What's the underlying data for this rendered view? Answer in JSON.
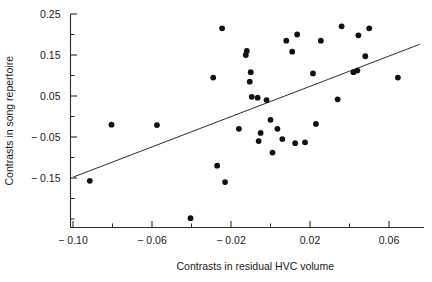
{
  "chart_data": {
    "type": "scatter",
    "title": "",
    "xlabel": "Contrasts in residual HVC volume",
    "ylabel": "Contrasts in song repertoire",
    "xlim": [
      -0.108,
      0.082
    ],
    "ylim": [
      -0.262,
      0.262
    ],
    "grid": false,
    "legend": null,
    "x_ticks": [
      -0.1,
      -0.08,
      -0.06,
      -0.04,
      -0.02,
      0.0,
      0.02,
      0.04,
      0.06,
      0.08
    ],
    "x_tick_labels": [
      "-0.10",
      "",
      "-0.06",
      "",
      "-0.02",
      "",
      "0.02",
      "",
      "0.06",
      ""
    ],
    "y_ticks": [
      0.25,
      0.2,
      0.15,
      0.1,
      0.05,
      0.0,
      -0.05,
      -0.1,
      -0.15,
      -0.2,
      -0.25
    ],
    "y_tick_labels": [
      "0.25",
      "",
      "0.15",
      "",
      "0.05",
      "",
      "-0.05",
      "",
      "-0.15",
      "",
      ""
    ],
    "points": [
      {
        "x": -0.0915,
        "y": -0.157
      },
      {
        "x": -0.0805,
        "y": -0.02
      },
      {
        "x": -0.0575,
        "y": -0.021
      },
      {
        "x": -0.0405,
        "y": -0.248
      },
      {
        "x": -0.029,
        "y": 0.095
      },
      {
        "x": -0.027,
        "y": -0.12
      },
      {
        "x": -0.0245,
        "y": 0.215
      },
      {
        "x": -0.023,
        "y": -0.16
      },
      {
        "x": -0.016,
        "y": -0.03
      },
      {
        "x": -0.0125,
        "y": 0.15
      },
      {
        "x": -0.012,
        "y": 0.16
      },
      {
        "x": -0.0105,
        "y": 0.085
      },
      {
        "x": -0.01,
        "y": 0.108
      },
      {
        "x": -0.0095,
        "y": 0.048
      },
      {
        "x": -0.0065,
        "y": 0.046
      },
      {
        "x": -0.006,
        "y": -0.06
      },
      {
        "x": -0.005,
        "y": -0.04
      },
      {
        "x": -0.002,
        "y": 0.04
      },
      {
        "x": 0.0,
        "y": -0.008
      },
      {
        "x": 0.001,
        "y": -0.088
      },
      {
        "x": 0.0035,
        "y": -0.03
      },
      {
        "x": 0.006,
        "y": -0.055
      },
      {
        "x": 0.008,
        "y": 0.185
      },
      {
        "x": 0.011,
        "y": 0.158
      },
      {
        "x": 0.0125,
        "y": -0.065
      },
      {
        "x": 0.0135,
        "y": 0.2
      },
      {
        "x": 0.0175,
        "y": -0.063
      },
      {
        "x": 0.0215,
        "y": 0.105
      },
      {
        "x": 0.023,
        "y": -0.018
      },
      {
        "x": 0.0255,
        "y": 0.185
      },
      {
        "x": 0.034,
        "y": 0.042
      },
      {
        "x": 0.036,
        "y": 0.22
      },
      {
        "x": 0.042,
        "y": 0.108
      },
      {
        "x": 0.044,
        "y": 0.112
      },
      {
        "x": 0.0445,
        "y": 0.198
      },
      {
        "x": 0.048,
        "y": 0.147
      },
      {
        "x": 0.05,
        "y": 0.215
      },
      {
        "x": 0.0645,
        "y": 0.095
      }
    ],
    "fit_line": {
      "x_start": -0.1,
      "y_start": -0.148,
      "x_end": 0.0755,
      "y_end": 0.176
    }
  }
}
